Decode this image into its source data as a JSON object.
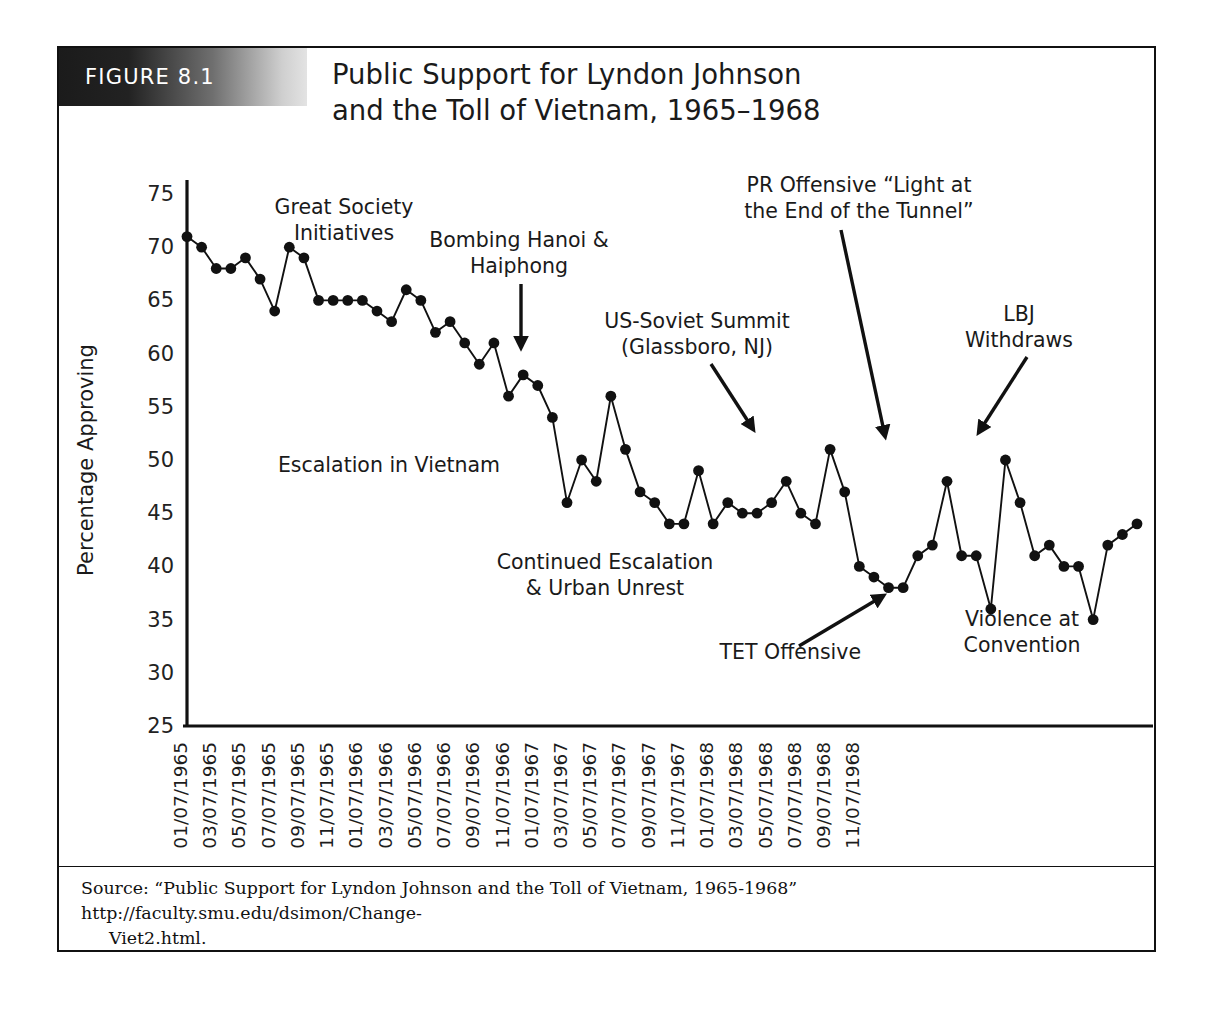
{
  "figure": {
    "tab_label": "FIGURE 8.1",
    "title_line1": "Public Support for Lyndon Johnson",
    "title_line2": "and the Toll of Vietnam, 1965–1968",
    "source_main": "Source: “Public Support for Lyndon Johnson and the Toll of Vietnam, 1965-1968” http://faculty.smu.edu/dsimon/Change-",
    "source_cont": "Viet2.html."
  },
  "colors": {
    "ink": "#111111",
    "marker": "#111111",
    "line": "#111111",
    "background": "#ffffff",
    "tab_dark": "#1b1b1b",
    "tab_light": "#e3e3e3"
  },
  "chart_data": {
    "type": "line",
    "title": "Public Support for Lyndon Johnson and the Toll of Vietnam, 1965–1968",
    "xlabel": "Beginning Date of Poll",
    "ylabel": "Percentage Approving",
    "ylim": [
      25,
      75
    ],
    "ytick_step": 5,
    "yticks": [
      25,
      30,
      35,
      40,
      45,
      50,
      55,
      60,
      65,
      70,
      75
    ],
    "grid": false,
    "legend": "none",
    "marker": "filled-circle",
    "x": [
      "01/07/1965",
      "02/07/1965",
      "03/07/1965",
      "04/07/1965",
      "05/07/1965",
      "06/07/1965",
      "07/07/1965",
      "08/07/1965",
      "09/07/1965",
      "10/07/1965",
      "11/07/1965",
      "12/07/1965",
      "01/07/1966",
      "02/07/1966",
      "03/07/1966",
      "04/07/1966",
      "05/07/1966",
      "06/07/1966",
      "07/07/1966",
      "08/07/1966",
      "09/07/1966",
      "10/07/1966",
      "11/07/1966",
      "12/07/1966",
      "01/07/1967",
      "02/07/1967",
      "03/07/1967",
      "04/07/1967",
      "05/07/1967",
      "06/07/1967",
      "07/07/1967",
      "08/07/1967",
      "09/07/1967",
      "10/07/1967",
      "11/07/1967",
      "12/07/1967",
      "01/07/1968",
      "02/07/1968",
      "03/07/1968",
      "04/07/1968",
      "05/07/1968",
      "06/07/1968",
      "07/07/1968",
      "08/07/1968",
      "09/07/1968",
      "10/07/1968",
      "11/07/1968",
      "12/07/1968"
    ],
    "xtick_labels": [
      "01/07/1965",
      "03/07/1965",
      "05/07/1965",
      "07/07/1965",
      "09/07/1965",
      "11/07/1965",
      "01/07/1966",
      "03/07/1966",
      "05/07/1966",
      "07/07/1966",
      "09/07/1966",
      "11/07/1966",
      "01/07/1967",
      "03/07/1967",
      "05/07/1967",
      "07/07/1967",
      "09/07/1967",
      "11/07/1967",
      "01/07/1968",
      "03/07/1968",
      "05/07/1968",
      "07/07/1968",
      "09/07/1968",
      "11/07/1968"
    ],
    "values": [
      71,
      70,
      68,
      68,
      69,
      67,
      64,
      70,
      69,
      65,
      65,
      65,
      65,
      64,
      63,
      66,
      65,
      62,
      63,
      61,
      59,
      61,
      56,
      58,
      57,
      54,
      46,
      50,
      48,
      56,
      51,
      47,
      46,
      44,
      44,
      49,
      44,
      46,
      45,
      45,
      46,
      48,
      45,
      44,
      51,
      47,
      40,
      39
    ],
    "values_tail": [
      38,
      38,
      41,
      42,
      48,
      41,
      41,
      36,
      50,
      46,
      41,
      42,
      40,
      40,
      35,
      42,
      43,
      44
    ],
    "series_name": "Percentage Approving",
    "annotations": [
      {
        "id": "great-society",
        "text_lines": [
          "Great Society",
          "Initiatives"
        ],
        "arrow": false
      },
      {
        "id": "escalation-vietnam",
        "text_lines": [
          "Escalation in Vietnam"
        ],
        "arrow": false
      },
      {
        "id": "bombing-hanoi",
        "text_lines": [
          "Bombing Hanoi &",
          "Haiphong"
        ],
        "arrow": true
      },
      {
        "id": "us-soviet-summit",
        "text_lines": [
          "US-Soviet Summit",
          "(Glassboro, NJ)"
        ],
        "arrow": true
      },
      {
        "id": "pr-offensive",
        "text_lines": [
          "PR Offensive “Light at",
          "the End of the Tunnel”"
        ],
        "arrow": true
      },
      {
        "id": "lbj-withdraws",
        "text_lines": [
          "LBJ",
          "Withdraws"
        ],
        "arrow": true
      },
      {
        "id": "continued-escalation",
        "text_lines": [
          "Continued Escalation",
          "& Urban Unrest"
        ],
        "arrow": false
      },
      {
        "id": "tet-offensive",
        "text_lines": [
          "TET Offensive"
        ],
        "arrow": true
      },
      {
        "id": "violence-convention",
        "text_lines": [
          "Violence at",
          "Convention"
        ],
        "arrow": false
      }
    ]
  },
  "annotations_text": {
    "great_society_1": "Great Society",
    "great_society_2": "Initiatives",
    "escalation": "Escalation in Vietnam",
    "bombing_1": "Bombing Hanoi &",
    "bombing_2": "Haiphong",
    "summit_1": "US-Soviet Summit",
    "summit_2": "(Glassboro, NJ)",
    "pr_1": "PR Offensive “Light at",
    "pr_2": "the End of the Tunnel”",
    "lbj_1": "LBJ",
    "lbj_2": "Withdraws",
    "continued_1": "Continued Escalation",
    "continued_2": "& Urban Unrest",
    "tet": "TET Offensive",
    "violence_1": "Violence at",
    "violence_2": "Convention"
  },
  "axis": {
    "y_title": "Percentage Approving",
    "x_title": "Beginning Date of Poll"
  }
}
